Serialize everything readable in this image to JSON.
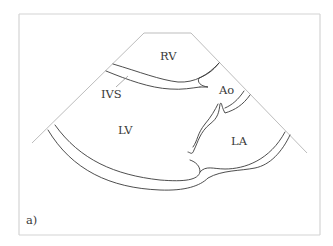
{
  "figure": {
    "type": "echocardiography schematic",
    "view": "parasternal long-axis",
    "panel_label": "a)",
    "labels": {
      "rv": "RV",
      "ivs": "IVS",
      "ao": "Ao",
      "lv": "LV",
      "la": "LA"
    },
    "colors": {
      "outline": "#3a3a3a",
      "sector_edge": "#bdbdbd",
      "frame": "#d4d4d4",
      "background": "#ffffff"
    }
  }
}
